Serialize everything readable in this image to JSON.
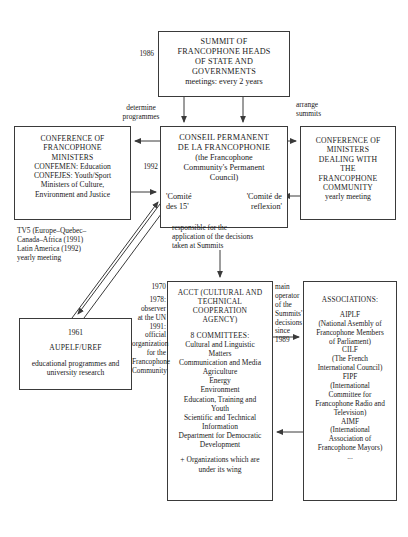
{
  "diagram": {
    "boxes": {
      "summit": {
        "lines": [
          "SUMMIT OF",
          "FRANCOPHONE HEADS",
          "OF STATE AND",
          "GOVERNMENTS"
        ],
        "subtitle": "meetings: every 2 years"
      },
      "conseil_permanent": {
        "lines": [
          "CONSEIL PERMANENT",
          "DE LA FRANCOPHONIE"
        ],
        "subtitle": [
          "(the Francophone",
          "Community's Permanent",
          "Council)"
        ],
        "committee_left": [
          "'Comité",
          "des 15'"
        ],
        "committee_right": [
          "'Comité de",
          "reflexion'"
        ]
      },
      "conference_francophone_ministers": {
        "lines": [
          "CONFERENCE OF",
          "FRANCOPHONE",
          "MINISTERS"
        ],
        "details": [
          "CONFEMEN: Education",
          "CONFEJES: Youth/Sport",
          "Ministers of Culture,",
          "Environment and Justice"
        ]
      },
      "conference_ministers_dealing": {
        "lines": [
          "CONFERENCE OF",
          "MINISTERS",
          "DEALING WITH",
          "THE",
          "FRANCOPHONE",
          "COMMUNITY"
        ],
        "subtitle": "yearly meeting"
      },
      "acct": {
        "lines": [
          "ACCT (CULTURAL AND",
          "TECHNICAL",
          "COOPERATION",
          "AGENCY)"
        ],
        "committees_heading": "8 COMMITTEES:",
        "committees": [
          "Cultural and Linguistic",
          "Matters",
          "Communication and Media",
          "Agriculture",
          "Energy",
          "Environment",
          "Education, Training and",
          "Youth",
          "Scientific and Technical",
          "Information",
          "Department for Democratic",
          "Development"
        ],
        "footer": [
          "+ Organizations which are",
          "under its wing"
        ]
      },
      "associations": {
        "heading": "ASSOCIATIONS:",
        "entries": [
          "AIPLF",
          "(National Asembly of",
          "Francophone Members",
          "of Parliament)",
          "CILF",
          "(The French",
          "International Council)",
          "FIPF",
          "(International",
          "Committee for",
          "Francophone Radio and",
          "Television)",
          "AIMF",
          "(International",
          "Association of",
          "Francophone Mayors)",
          "..."
        ]
      },
      "aupelf": {
        "year": "1961",
        "name": "AUPELF/UREF",
        "description": [
          "educational programmes and",
          "university research"
        ]
      }
    },
    "notes": {
      "summit_year": "1986",
      "determine_programmes": [
        "determine",
        "programmes"
      ],
      "arrange_summits": [
        "arrange",
        "summits"
      ],
      "cpf_year": "1992",
      "responsible": [
        "responsible for the",
        "application of the decisions",
        "taken at Summits"
      ],
      "tv5": [
        "TV5 (Europe–Quebec–",
        "Canada–Africa (1991)",
        "Latin America (1992)",
        "yearly meeting"
      ],
      "acct_left": [
        "1970",
        "1978:",
        "observer",
        "at the UN",
        "1991:",
        "official",
        "organization",
        "for the",
        "Francophone",
        "Community"
      ],
      "acct_right": [
        "main",
        "operator",
        "of the",
        "Summits'",
        "decisions",
        "since",
        "1989"
      ]
    },
    "colors": {
      "line": "#3a3a3a",
      "text": "#1a1a1a",
      "background": "#ffffff"
    }
  }
}
